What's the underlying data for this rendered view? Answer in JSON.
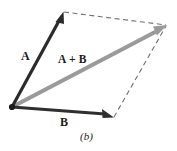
{
  "figure": {
    "caption": "(b)",
    "background_color": "#ffffff",
    "labels": {
      "vector_a": "A",
      "vector_b": "B",
      "resultant": "A + B"
    },
    "colors": {
      "vector_a": "#2b2b2b",
      "vector_b": "#2f2f2f",
      "resultant": "#9a9a9a",
      "dashed": "#707070",
      "origin_dot": "#1a1a1a",
      "text": "#1a1a1a"
    },
    "geometry": {
      "origin": {
        "x": 12,
        "y": 107
      },
      "vector_a_tip": {
        "x": 63,
        "y": 12
      },
      "vector_b_tip": {
        "x": 113,
        "y": 117
      },
      "resultant_tip": {
        "x": 166,
        "y": 26
      },
      "dashed_top": {
        "x1": 64,
        "y1": 12,
        "x2": 166,
        "y2": 25
      },
      "dashed_right": {
        "x1": 114,
        "y1": 117,
        "x2": 166,
        "y2": 26
      }
    },
    "stroke_widths": {
      "vector_a": 3.2,
      "vector_b": 3.2,
      "resultant": 4.2,
      "dashed": 1.1
    }
  }
}
